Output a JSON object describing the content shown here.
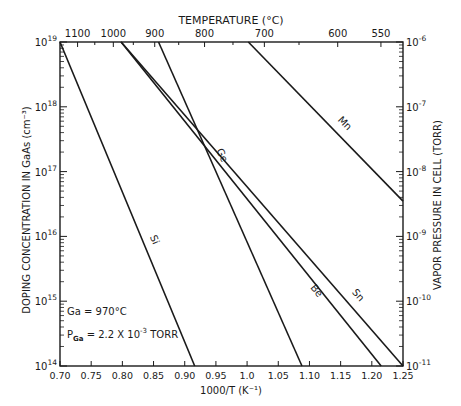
{
  "chart_data": {
    "type": "line",
    "title": "",
    "top_axis": {
      "label": "TEMPERATURE (°C)",
      "ticks": [
        {
          "label": "1100",
          "x": 0.7282
        },
        {
          "label": "1000",
          "x": 0.7855
        },
        {
          "label": "900",
          "x": 0.8519
        },
        {
          "label": "800",
          "x": 0.9318
        },
        {
          "label": "700",
          "x": 1.0277
        },
        {
          "label": "600",
          "x": 1.1453
        },
        {
          "label": "550",
          "x": 1.2146
        }
      ]
    },
    "xlabel": "1000/T (K⁻¹)",
    "xlim": [
      0.7,
      1.25
    ],
    "xticks": [
      "0.70",
      "0.75",
      "0.80",
      "0.85",
      "0.90",
      "0.95",
      "1.0",
      "1.05",
      "1.10",
      "1.15",
      "1.20",
      "1.25"
    ],
    "ylabel": "DOPING CONCENTRATION IN GaAs (cm⁻³)",
    "ylim": [
      100000000000000.0,
      1e+19
    ],
    "yscale": "log",
    "yticks": [
      {
        "base": "10",
        "exp": "19"
      },
      {
        "base": "10",
        "exp": "18"
      },
      {
        "base": "10",
        "exp": "17"
      },
      {
        "base": "10",
        "exp": "16"
      },
      {
        "base": "10",
        "exp": "15"
      },
      {
        "base": "10",
        "exp": "14"
      }
    ],
    "y2label": "VAPOR PRESSURE IN CELL (TORR)",
    "y2lim": [
      1e-11,
      1e-06
    ],
    "y2ticks": [
      {
        "base": "10",
        "exp": "-6"
      },
      {
        "base": "10",
        "exp": "-7"
      },
      {
        "base": "10",
        "exp": "-8"
      },
      {
        "base": "10",
        "exp": "-9"
      },
      {
        "base": "10",
        "exp": "-10"
      },
      {
        "base": "10",
        "exp": "-11"
      }
    ],
    "series": [
      {
        "name": "Si",
        "x": [
          0.7,
          0.916
        ],
        "y": [
          1e+19,
          100000000000000.0
        ]
      },
      {
        "name": "Ge",
        "x": [
          0.858,
          1.088
        ],
        "y": [
          1e+19,
          100000000000000.0
        ]
      },
      {
        "name": "Be",
        "x": [
          0.798,
          1.215
        ],
        "y": [
          1e+19,
          100000000000000.0
        ]
      },
      {
        "name": "Sn",
        "x": [
          0.798,
          1.25
        ],
        "y": [
          1e+19,
          100000000000000.0
        ]
      },
      {
        "name": "Mn",
        "x": [
          1.002,
          1.25
        ],
        "y": [
          1e+19,
          3.5e+16
        ]
      }
    ],
    "annotations": [
      {
        "text": "Ga = 970°C"
      },
      {
        "text_main": "P",
        "text_sub": "Ga",
        "text_rest": " = 2.2 X 10",
        "text_sup": "-3",
        "text_tail": " TORR"
      }
    ],
    "grid": false,
    "legend": "inline labels on lines"
  }
}
